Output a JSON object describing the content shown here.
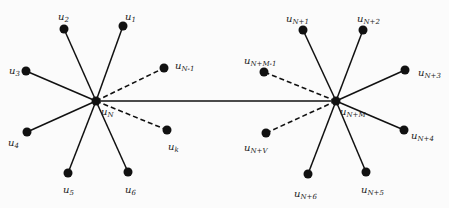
{
  "diagram": {
    "type": "two-star network connected by a bridge edge",
    "hubs": [
      {
        "id": "uN",
        "label": "u",
        "sub": "N",
        "x": 96,
        "y": 101,
        "lx": 101,
        "ly": 107
      },
      {
        "id": "uNM",
        "label": "u",
        "sub": "N+M",
        "x": 336,
        "y": 101,
        "lx": 340,
        "ly": 107
      }
    ],
    "bridge": {
      "from": "uN",
      "to": "uNM",
      "style": "solid"
    },
    "nodes": [
      {
        "id": "u2",
        "label": "u",
        "sub": "2",
        "x": 64,
        "y": 29,
        "lx": 58,
        "ly": 12,
        "hub": "uN",
        "style": "solid"
      },
      {
        "id": "u1",
        "label": "u",
        "sub": "1",
        "x": 123,
        "y": 26,
        "lx": 125,
        "ly": 12,
        "hub": "uN",
        "style": "solid"
      },
      {
        "id": "u3",
        "label": "u",
        "sub": "3",
        "x": 26,
        "y": 71,
        "lx": 9,
        "ly": 66,
        "hub": "uN",
        "style": "solid"
      },
      {
        "id": "uN-1",
        "label": "u",
        "sub": "N-1",
        "x": 164,
        "y": 68,
        "lx": 175,
        "ly": 61,
        "hub": "uN",
        "style": "dashed"
      },
      {
        "id": "u4",
        "label": "u",
        "sub": "4",
        "x": 27,
        "y": 132,
        "lx": 8,
        "ly": 138,
        "hub": "uN",
        "style": "solid"
      },
      {
        "id": "uk",
        "label": "u",
        "sub": "k",
        "x": 167,
        "y": 130,
        "lx": 168,
        "ly": 142,
        "hub": "uN",
        "style": "dashed"
      },
      {
        "id": "u5",
        "label": "u",
        "sub": "5",
        "x": 68,
        "y": 173,
        "lx": 63,
        "ly": 185,
        "hub": "uN",
        "style": "solid"
      },
      {
        "id": "u6",
        "label": "u",
        "sub": "6",
        "x": 128,
        "y": 172,
        "lx": 125,
        "ly": 185,
        "hub": "uN",
        "style": "solid"
      },
      {
        "id": "uN+1",
        "label": "u",
        "sub": "N+1",
        "x": 303,
        "y": 30,
        "lx": 286,
        "ly": 14,
        "hub": "uNM",
        "style": "solid"
      },
      {
        "id": "uN+2",
        "label": "u",
        "sub": "N+2",
        "x": 363,
        "y": 30,
        "lx": 357,
        "ly": 14,
        "hub": "uNM",
        "style": "solid"
      },
      {
        "id": "uN+M-1",
        "label": "u",
        "sub": "N+M-1",
        "x": 264,
        "y": 72,
        "lx": 244,
        "ly": 56,
        "hub": "uNM",
        "style": "dashed"
      },
      {
        "id": "uN+3",
        "label": "u",
        "sub": "N+3",
        "x": 405,
        "y": 70,
        "lx": 418,
        "ly": 68,
        "hub": "uNM",
        "style": "solid"
      },
      {
        "id": "uN+V",
        "label": "u",
        "sub": "N+V",
        "x": 266,
        "y": 133,
        "lx": 244,
        "ly": 143,
        "hub": "uNM",
        "style": "dashed"
      },
      {
        "id": "uN+4",
        "label": "u",
        "sub": "N+4",
        "x": 404,
        "y": 130,
        "lx": 411,
        "ly": 131,
        "hub": "uNM",
        "style": "solid"
      },
      {
        "id": "uN+6",
        "label": "u",
        "sub": "N+6",
        "x": 308,
        "y": 174,
        "lx": 294,
        "ly": 189,
        "hub": "uNM",
        "style": "solid"
      },
      {
        "id": "uN+5",
        "label": "u",
        "sub": "N+5",
        "x": 366,
        "y": 172,
        "lx": 361,
        "ly": 185,
        "hub": "uNM",
        "style": "solid"
      }
    ]
  }
}
